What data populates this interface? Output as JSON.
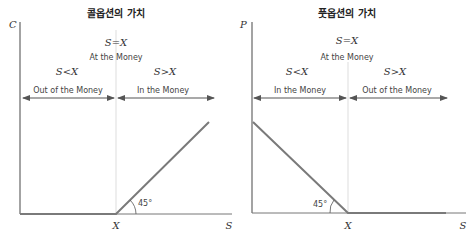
{
  "colors": {
    "axis": "#555555",
    "payoff": "#777777",
    "guide": "#cccccc",
    "arrow": "#555555"
  },
  "call": {
    "title": "콜옵션의 가치",
    "y_label": "C",
    "x_label": "S",
    "strike_label": "X",
    "atm_condition": "S=X",
    "atm_label": "At the Money",
    "left_condition": "S<X",
    "left_label": "Out of the Money",
    "right_condition": "S>X",
    "right_label": "In the Money",
    "angle_label": "45°"
  },
  "put": {
    "title": "풋옵션의 가치",
    "y_label": "P",
    "x_label": "S",
    "strike_label": "X",
    "atm_condition": "S=X",
    "atm_label": "At the Money",
    "left_condition": "S<X",
    "left_label": "In the Money",
    "right_condition": "S>X",
    "right_label": "Out of the Money",
    "angle_label": "45°"
  }
}
